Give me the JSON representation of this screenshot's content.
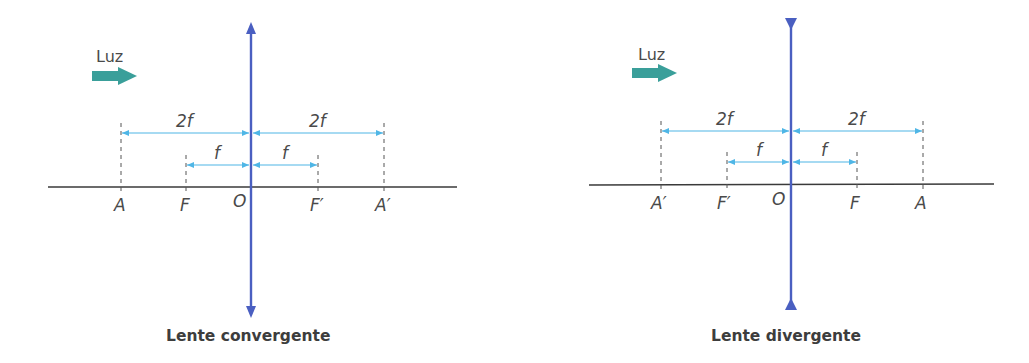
{
  "colors": {
    "lens": "#4a5fc1",
    "dimension": "#4fb6e6",
    "axis": "#3a3a3a",
    "light_arrow": "#3a9f9a",
    "text": "#4a4a4a"
  },
  "diagrams": [
    {
      "id": "convergente",
      "light_label": "Luz",
      "title": "Lente convergente",
      "lens_type": "convergent",
      "points": {
        "A": "A",
        "F": "F",
        "O": "O",
        "F2": "F′",
        "A2": "A′"
      },
      "dimensions": {
        "left_2f": "2f",
        "right_2f": "2f",
        "left_f": "f",
        "right_f": "f"
      }
    },
    {
      "id": "divergente",
      "light_label": "Luz",
      "title": "Lente divergente",
      "lens_type": "divergent",
      "points": {
        "A": "A′",
        "F": "F′",
        "O": "O",
        "F2": "F",
        "A2": "A"
      },
      "dimensions": {
        "left_2f": "2f",
        "right_2f": "2f",
        "left_f": "f",
        "right_f": "f"
      }
    }
  ]
}
